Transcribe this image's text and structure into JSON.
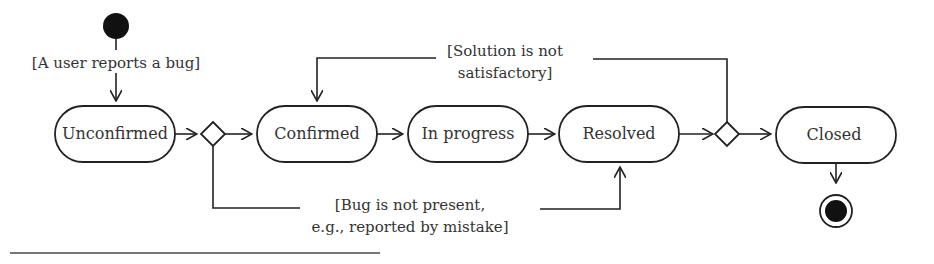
{
  "diagram": {
    "type": "UML activity diagram",
    "states": [
      {
        "id": "unconfirmed",
        "label": "Unconfirmed"
      },
      {
        "id": "confirmed",
        "label": "Confirmed"
      },
      {
        "id": "in_progress",
        "label": "In progress"
      },
      {
        "id": "resolved",
        "label": "Resolved"
      },
      {
        "id": "closed",
        "label": "Closed"
      }
    ],
    "guards": {
      "initial": "[A user reports a bug]",
      "not_satisfactory_line1": "[Solution is not",
      "not_satisfactory_line2": "satisfactory]",
      "not_present_line1": "[Bug is not present,",
      "not_present_line2": "e.g., reported by mistake]"
    },
    "transitions": [
      {
        "from": "initial",
        "to": "unconfirmed",
        "guard": "[A user reports a bug]"
      },
      {
        "from": "unconfirmed",
        "to": "decision-1"
      },
      {
        "from": "decision-1",
        "to": "confirmed"
      },
      {
        "from": "decision-1",
        "to": "resolved",
        "guard": "[Bug is not present, e.g., reported by mistake]"
      },
      {
        "from": "confirmed",
        "to": "in_progress"
      },
      {
        "from": "in_progress",
        "to": "resolved"
      },
      {
        "from": "resolved",
        "to": "decision-2"
      },
      {
        "from": "decision-2",
        "to": "closed"
      },
      {
        "from": "decision-2",
        "to": "confirmed",
        "guard": "[Solution is not satisfactory]"
      },
      {
        "from": "closed",
        "to": "final"
      }
    ]
  }
}
